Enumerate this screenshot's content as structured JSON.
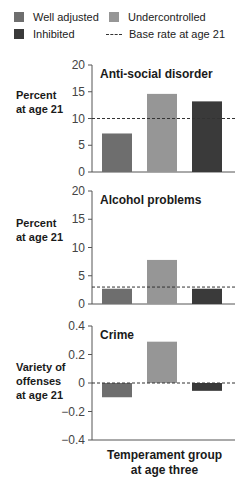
{
  "legend": {
    "items": [
      {
        "label": "Well adjusted",
        "color": "#6e6e6e",
        "kind": "bar"
      },
      {
        "label": "Undercontrolled",
        "color": "#969696",
        "kind": "bar"
      },
      {
        "label": "Inhibited",
        "color": "#3a3a3a",
        "kind": "bar"
      },
      {
        "label": "Base rate at age 21",
        "color": "#333333",
        "kind": "dashed-line"
      }
    ]
  },
  "panels": [
    {
      "title": "Anti-social disorder",
      "ylabel_line1": "Percent",
      "ylabel_line2": "at age 21",
      "ylabel_line3": ""
    },
    {
      "title": "Alcohol problems",
      "ylabel_line1": "Percent",
      "ylabel_line2": "at age 21",
      "ylabel_line3": ""
    },
    {
      "title": "Crime",
      "ylabel_line1": "Variety of",
      "ylabel_line2": "offenses",
      "ylabel_line3": "at age 21"
    }
  ],
  "xlabel_line1": "Temperament group",
  "xlabel_line2": "at age three",
  "chart_data": [
    {
      "type": "bar",
      "title": "Anti-social disorder",
      "xlabel": "Temperament group at age three",
      "ylabel": "Percent at age 21",
      "categories": [
        "Well adjusted",
        "Undercontrolled",
        "Inhibited"
      ],
      "values": [
        7.2,
        14.6,
        13.2
      ],
      "colors": [
        "#6e6e6e",
        "#969696",
        "#3a3a3a"
      ],
      "base_rate": 10,
      "ylim": [
        0,
        20
      ],
      "yticks": [
        0,
        5,
        10,
        15,
        20
      ],
      "grid": false,
      "legend_position": "top"
    },
    {
      "type": "bar",
      "title": "Alcohol problems",
      "xlabel": "Temperament group at age three",
      "ylabel": "Percent at age 21",
      "categories": [
        "Well adjusted",
        "Undercontrolled",
        "Inhibited"
      ],
      "values": [
        2.7,
        7.8,
        2.7
      ],
      "colors": [
        "#6e6e6e",
        "#969696",
        "#3a3a3a"
      ],
      "base_rate": 3,
      "ylim": [
        0,
        20
      ],
      "yticks": [
        0,
        5,
        10,
        15,
        20
      ],
      "grid": false,
      "legend_position": "top"
    },
    {
      "type": "bar",
      "title": "Crime",
      "xlabel": "Temperament group at age three",
      "ylabel": "Variety of offenses at age 21",
      "categories": [
        "Well adjusted",
        "Undercontrolled",
        "Inhibited"
      ],
      "values": [
        -0.1,
        0.29,
        -0.055
      ],
      "colors": [
        "#6e6e6e",
        "#969696",
        "#3a3a3a"
      ],
      "base_rate": 0,
      "ylim": [
        -0.4,
        0.4
      ],
      "yticks": [
        -0.4,
        -0.2,
        0,
        0.2,
        0.4
      ],
      "ytick_labels": [
        "−0.4",
        "−0.2",
        "0",
        "0.2",
        "0.4"
      ],
      "grid": false,
      "legend_position": "top"
    }
  ]
}
